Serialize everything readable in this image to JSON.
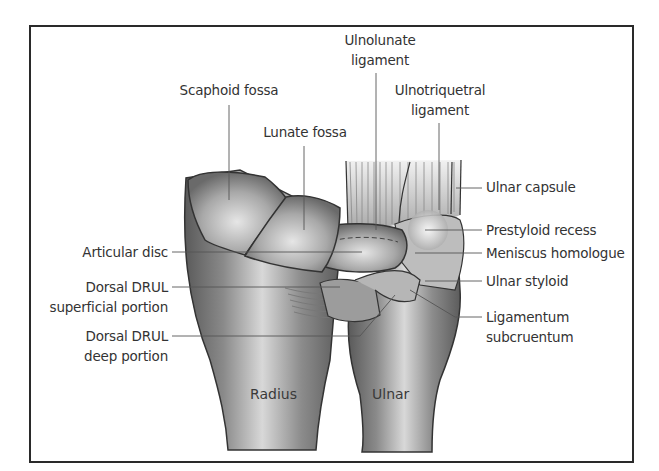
{
  "figure": {
    "type": "anatomical-illustration",
    "frame_color": "#2a2a2a",
    "labels": {
      "scaphoid_fossa": "Scaphoid fossa",
      "lunate_fossa": "Lunate fossa",
      "ulnolunate_line1": "Ulnolunate",
      "ulnolunate_line2": "ligament",
      "ulnotriquetral_line1": "Ulnotriquetral",
      "ulnotriquetral_line2": "ligament",
      "ulnar_capsule": "Ulnar capsule",
      "prestyloid_recess": "Prestyloid recess",
      "meniscus_homologue": "Meniscus homologue",
      "ulnar_styloid": "Ulnar styloid",
      "ligamentum_line1": "Ligamentum",
      "ligamentum_line2": "subcruentum",
      "articular_disc": "Articular disc",
      "drul_superficial_line1": "Dorsal DRUL",
      "drul_superficial_line2": "superficial portion",
      "drul_deep_line1": "Dorsal DRUL",
      "drul_deep_line2": "deep portion",
      "radius": "Radius",
      "ulnar": "Ulnar"
    }
  }
}
